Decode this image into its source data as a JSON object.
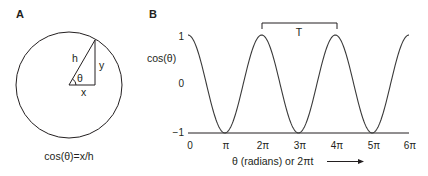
{
  "panels": {
    "a": {
      "label": "A",
      "triangle_labels": {
        "hypotenuse": "h",
        "opposite": "y",
        "angle": "θ",
        "adjacent": "x"
      },
      "caption": "cos(θ)=x/h"
    },
    "b": {
      "label": "B",
      "period_label": "T",
      "ylabel": "cos(θ)",
      "xlabel": "θ (radians) or 2πt",
      "y_ticks": [
        "1",
        "0",
        "−1"
      ],
      "x_ticks": [
        "0",
        "π",
        "2π",
        "3π",
        "4π",
        "5π",
        "6π"
      ]
    }
  },
  "chart_data": {
    "type": "line",
    "title": "",
    "xlabel": "θ (radians) or 2πt",
    "ylabel": "cos(θ)",
    "x_tick_labels": [
      "0",
      "π",
      "2π",
      "3π",
      "4π",
      "5π",
      "6π"
    ],
    "y_tick_labels": [
      "1",
      "0",
      "-1"
    ],
    "xlim": [
      0,
      18.85
    ],
    "ylim": [
      -1,
      1
    ],
    "grid": false,
    "series": [
      {
        "name": "cos(θ)",
        "function": "cos(theta)",
        "x": [
          0,
          3.1416,
          6.2832,
          9.4248,
          12.5664,
          15.708,
          18.8496
        ],
        "values": [
          1,
          -1,
          1,
          -1,
          1,
          -1,
          1
        ]
      }
    ],
    "annotations": [
      {
        "type": "bracket",
        "label": "T",
        "from_x": "2π",
        "to_x": "4π",
        "meaning": "period"
      }
    ]
  }
}
